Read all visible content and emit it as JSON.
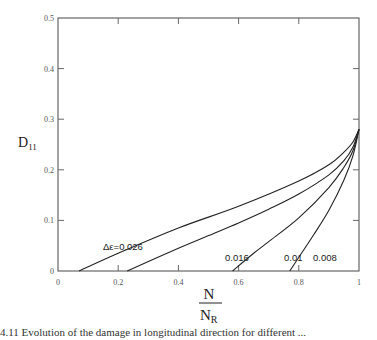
{
  "chart_data": {
    "type": "line",
    "title": "",
    "xlabel": "N / N_R",
    "ylabel": "D_11",
    "xlim": [
      0,
      1
    ],
    "ylim": [
      0,
      0.5
    ],
    "x_ticks": [
      "0",
      "0.2",
      "0.4",
      "0.6",
      "0.8",
      "1"
    ],
    "y_ticks": [
      "0",
      "0.1",
      "0.2",
      "0.3",
      "0.4",
      "0.5"
    ],
    "grid": false,
    "legend": "inline curve labels",
    "series": [
      {
        "name": "Δε=0.026",
        "label": "Δε=0.026",
        "x": [
          0.07,
          0.2,
          0.4,
          0.6,
          0.8,
          0.9,
          0.95,
          0.98,
          1.0
        ],
        "y": [
          0.0,
          0.035,
          0.085,
          0.128,
          0.178,
          0.21,
          0.235,
          0.255,
          0.28
        ]
      },
      {
        "name": "0.016",
        "label": "0.016",
        "x": [
          0.23,
          0.4,
          0.5,
          0.6,
          0.7,
          0.8,
          0.9,
          0.95,
          0.98,
          1.0
        ],
        "y": [
          0.0,
          0.045,
          0.07,
          0.095,
          0.122,
          0.152,
          0.19,
          0.218,
          0.245,
          0.28
        ]
      },
      {
        "name": "0.01",
        "label": "0.01",
        "x": [
          0.58,
          0.65,
          0.7,
          0.8,
          0.9,
          0.95,
          0.98,
          1.0
        ],
        "y": [
          0.0,
          0.035,
          0.058,
          0.105,
          0.165,
          0.205,
          0.238,
          0.28
        ]
      },
      {
        "name": "0.008",
        "label": "0.008",
        "x": [
          0.77,
          0.82,
          0.85,
          0.9,
          0.95,
          0.98,
          1.0
        ],
        "y": [
          0.0,
          0.045,
          0.072,
          0.12,
          0.18,
          0.228,
          0.28
        ]
      }
    ]
  },
  "axes": {
    "y_title_main": "D",
    "y_title_sub": "11",
    "x_title_num": "N",
    "x_title_den_main": "N",
    "x_title_den_sub": "R"
  },
  "caption": "4.11  Evolution of the damage in longitudinal direction for different ..."
}
